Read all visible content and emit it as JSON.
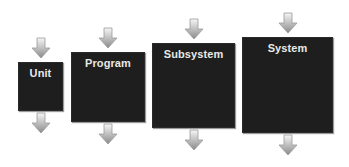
{
  "diagram": {
    "title": "",
    "stages": [
      {
        "label": "Unit"
      },
      {
        "label": "Program"
      },
      {
        "label": "Subsystem"
      },
      {
        "label": "System"
      }
    ],
    "colors": {
      "box_fill": "#1e1e1e",
      "label_text": "#e8e8e8",
      "arrow_light": "#f4f4f4",
      "arrow_dark": "#8a8a8a"
    }
  }
}
